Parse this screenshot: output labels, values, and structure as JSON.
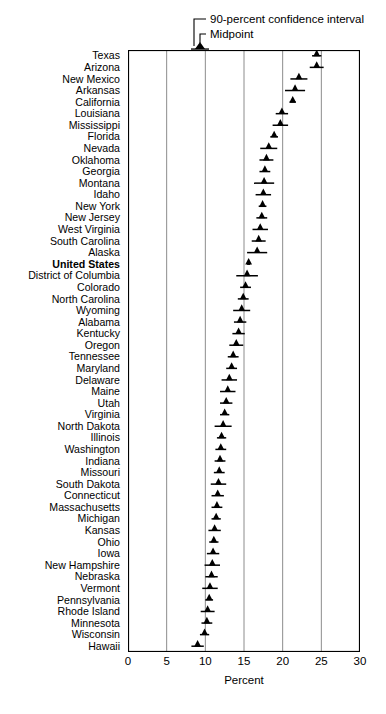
{
  "legend": {
    "ci_label": "90-percent confidence interval",
    "midpoint_label": "Midpoint"
  },
  "axis": {
    "title": "Percent",
    "ticks": [
      0,
      5,
      10,
      15,
      20,
      25,
      30
    ]
  },
  "chart_data": {
    "type": "scatter",
    "title": "",
    "xlabel": "Percent",
    "ylabel": "",
    "xlim": [
      0,
      30
    ],
    "grid": true,
    "gridlines_x": [
      5,
      10,
      15,
      20,
      25
    ],
    "legend_position": "top",
    "legend_entries": [
      "90-percent confidence interval",
      "Midpoint"
    ],
    "orientation": "horizontal",
    "marker": "triangle",
    "series_note": "Each row shows a midpoint (triangle) with a 90-percent confidence interval (horizontal whisker).",
    "categories": [
      "Texas",
      "Arizona",
      "New Mexico",
      "Arkansas",
      "California",
      "Louisiana",
      "Mississippi",
      "Florida",
      "Nevada",
      "Oklahoma",
      "Georgia",
      "Montana",
      "Idaho",
      "New York",
      "New Jersey",
      "West Virginia",
      "South Carolina",
      "Alaska",
      "United States",
      "District of Columbia",
      "Colorado",
      "North Carolina",
      "Wyoming",
      "Alabama",
      "Kentucky",
      "Oregon",
      "Tennessee",
      "Maryland",
      "Delaware",
      "Maine",
      "Utah",
      "Virginia",
      "North Dakota",
      "Illinois",
      "Washington",
      "Indiana",
      "Missouri",
      "South Dakota",
      "Connecticut",
      "Massachusetts",
      "Michigan",
      "Kansas",
      "Ohio",
      "Iowa",
      "New Hampshire",
      "Nebraska",
      "Vermont",
      "Pennsylvania",
      "Rhode Island",
      "Minnesota",
      "Wisconsin",
      "Hawaii"
    ],
    "highlighted_category": "United States",
    "values": [
      24.4,
      24.4,
      22.1,
      21.6,
      21.3,
      19.9,
      19.7,
      18.9,
      18.2,
      17.9,
      17.7,
      17.6,
      17.5,
      17.4,
      17.3,
      17.1,
      16.9,
      16.7,
      15.6,
      15.4,
      15.2,
      14.9,
      14.7,
      14.5,
      14.3,
      14.0,
      13.6,
      13.4,
      13.1,
      12.9,
      12.7,
      12.5,
      12.3,
      12.1,
      12.0,
      11.9,
      11.8,
      11.7,
      11.6,
      11.5,
      11.4,
      11.2,
      11.1,
      11.0,
      10.9,
      10.8,
      10.6,
      10.5,
      10.3,
      10.2,
      9.9,
      9.0
    ],
    "ci_low": [
      23.8,
      23.5,
      21.0,
      20.3,
      20.9,
      19.1,
      18.7,
      18.4,
      17.1,
      17.0,
      17.0,
      16.3,
      16.5,
      16.9,
      16.6,
      16.1,
      16.0,
      15.4,
      15.4,
      14.0,
      14.5,
      14.2,
      13.6,
      13.7,
      13.5,
      13.1,
      12.9,
      12.7,
      12.1,
      11.9,
      11.9,
      11.9,
      11.2,
      11.5,
      11.3,
      11.2,
      11.1,
      10.7,
      10.8,
      10.8,
      10.8,
      10.4,
      10.5,
      10.2,
      9.9,
      10.0,
      9.6,
      10.0,
      9.4,
      9.5,
      9.3,
      8.2
    ],
    "ci_high": [
      25.0,
      25.3,
      23.2,
      22.9,
      21.7,
      20.7,
      20.7,
      19.4,
      19.3,
      18.8,
      18.4,
      18.9,
      18.5,
      17.9,
      18.0,
      18.1,
      17.8,
      18.0,
      15.8,
      16.8,
      15.9,
      15.6,
      15.8,
      15.3,
      15.1,
      14.9,
      14.3,
      14.1,
      14.1,
      13.9,
      13.5,
      13.1,
      13.4,
      12.7,
      12.7,
      12.6,
      12.5,
      12.7,
      12.4,
      12.2,
      12.0,
      12.0,
      11.7,
      11.8,
      11.9,
      11.6,
      11.6,
      11.0,
      11.2,
      10.9,
      10.5,
      9.8
    ]
  }
}
